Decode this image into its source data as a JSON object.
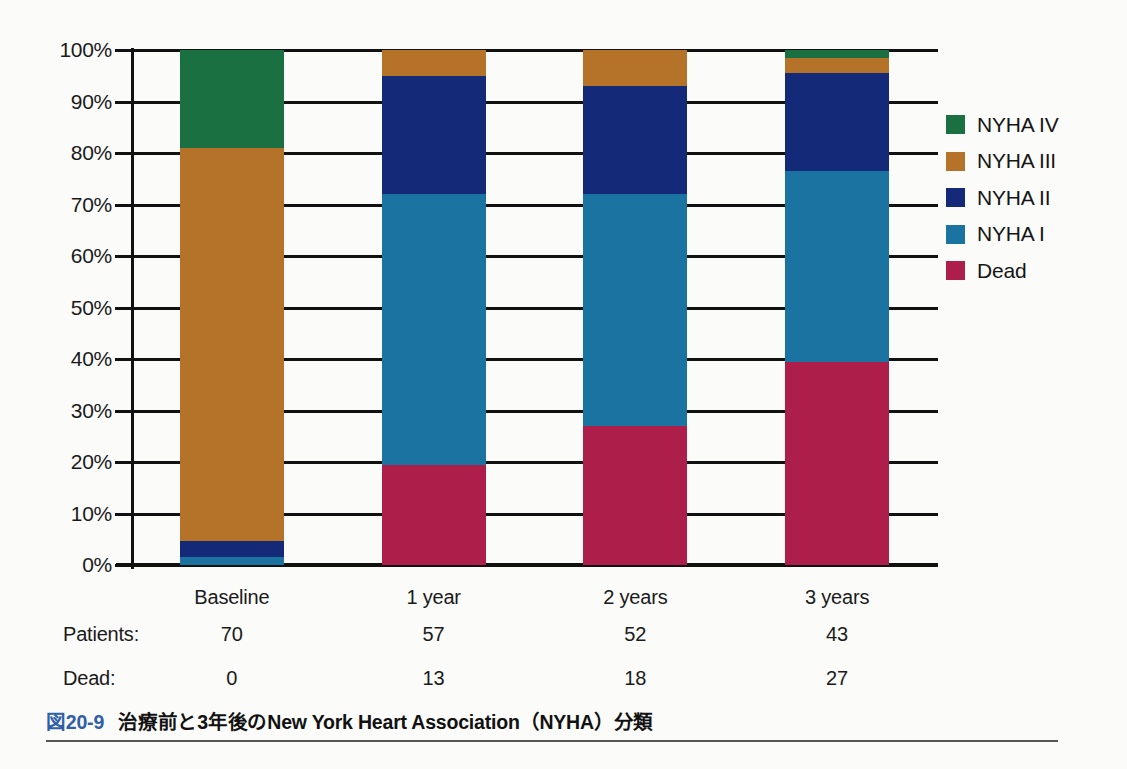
{
  "chart_data": {
    "type": "bar",
    "subtype": "stacked-percentage",
    "title": "",
    "xlabel": "",
    "ylabel": "",
    "ylim": [
      0,
      100
    ],
    "grid": true,
    "legend_position": "right",
    "categories": [
      "Baseline",
      "1 year",
      "2 years",
      "3 years"
    ],
    "ytick_labels": [
      "100%",
      "90%",
      "80%",
      "70%",
      "60%",
      "50%",
      "40%",
      "30%",
      "20%",
      "10%",
      "0%"
    ],
    "ytick_values": [
      100,
      90,
      80,
      70,
      60,
      50,
      40,
      30,
      20,
      10,
      0
    ],
    "series": [
      {
        "name": "Dead",
        "color": "#ad1f4a",
        "values": [
          0,
          19.5,
          27,
          39.5
        ]
      },
      {
        "name": "NYHA I",
        "color": "#1a73a0",
        "values": [
          1.5,
          52.5,
          45,
          37
        ]
      },
      {
        "name": "NYHA II",
        "color": "#142a78",
        "values": [
          3.2,
          23,
          21,
          19
        ]
      },
      {
        "name": "NYHA III",
        "color": "#b5732a",
        "values": [
          76.3,
          5,
          7,
          3
        ]
      },
      {
        "name": "NYHA IV",
        "color": "#1a7040",
        "values": [
          19,
          0,
          0,
          1.5
        ]
      }
    ],
    "legend": [
      {
        "label": "NYHA IV",
        "color": "#1a7040"
      },
      {
        "label": "NYHA III",
        "color": "#b5732a"
      },
      {
        "label": "NYHA II",
        "color": "#142a78"
      },
      {
        "label": "NYHA I",
        "color": "#1a73a0"
      },
      {
        "label": "Dead",
        "color": "#ad1f4a"
      }
    ],
    "table": {
      "rows": [
        {
          "label": "Patients:",
          "values": [
            "70",
            "57",
            "52",
            "43"
          ]
        },
        {
          "label": "Dead:",
          "values": [
            "0",
            "13",
            "18",
            "27"
          ]
        }
      ]
    }
  },
  "caption": {
    "number": "図20-9",
    "text": "治療前と3年後のNew York Heart Association（NYHA）分類",
    "number_color": "#2f5fa8"
  }
}
